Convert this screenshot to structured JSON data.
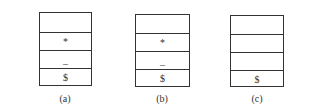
{
  "figure": {
    "panels": [
      {
        "label": "(a)",
        "cells": [
          "",
          "*",
          "_",
          "$"
        ]
      },
      {
        "label": "(b)",
        "cells": [
          "",
          "*",
          "_",
          "$"
        ]
      },
      {
        "label": "(c)",
        "cells": [
          "",
          "",
          "",
          "$"
        ]
      }
    ]
  }
}
